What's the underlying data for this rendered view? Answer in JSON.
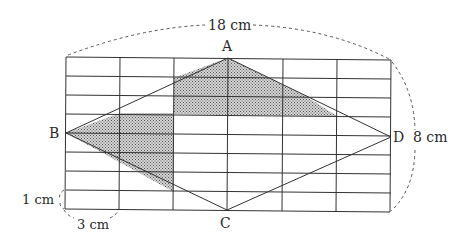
{
  "figure": {
    "labels": {
      "A": "A",
      "B": "B",
      "C": "C",
      "D": "D"
    },
    "dimensions": {
      "width": "18 cm",
      "height": "8 cm",
      "cell_height": "1 cm",
      "cell_width": "3 cm"
    },
    "grid": {
      "columns": 6,
      "rows": 8,
      "cell_width_cm": 3,
      "cell_height_cm": 1
    },
    "shading": {
      "pattern": "dotted",
      "color": "#8a8a8a",
      "regions": [
        "upper region right of B-column boundary between A, AD and 3rd row",
        "left region between BA, BC and 2nd column line"
      ]
    },
    "colors": {
      "line": "#333333",
      "background": "#ffffff"
    }
  }
}
